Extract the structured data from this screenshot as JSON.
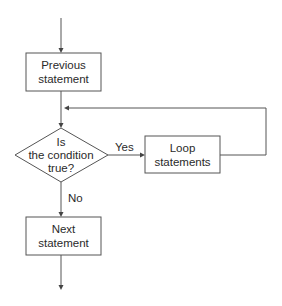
{
  "diagram": {
    "type": "flowchart",
    "nodes": {
      "previous": {
        "shape": "rectangle",
        "line1": "Previous",
        "line2": "statement"
      },
      "condition": {
        "shape": "diamond",
        "line1": "Is",
        "line2": "the condition",
        "line3": "true?"
      },
      "loop": {
        "shape": "rectangle",
        "line1": "Loop",
        "line2": "statements"
      },
      "next": {
        "shape": "rectangle",
        "line1": "Next",
        "line2": "statement"
      }
    },
    "edges": {
      "yes_label": "Yes",
      "no_label": "No"
    },
    "colors": {
      "stroke": "#555555",
      "text": "#2a2a2a",
      "background": "#ffffff"
    }
  }
}
